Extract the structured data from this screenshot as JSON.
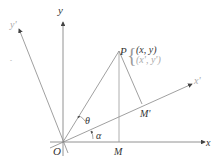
{
  "diagram": {
    "labels": {
      "x_axis": "x",
      "y_axis": "y",
      "x_prime_axis": "x'",
      "y_prime_axis": "y'",
      "origin": "O",
      "point": "P",
      "coords_xy": "(x, y)",
      "coords_prime": "(x', y')",
      "foot_m": "M",
      "foot_m_prime": "M'",
      "angle_theta": "θ",
      "angle_alpha": "α"
    },
    "colors": {
      "line": "#777777",
      "text": "#333333",
      "secondary_text": "#aaaaaa"
    }
  }
}
